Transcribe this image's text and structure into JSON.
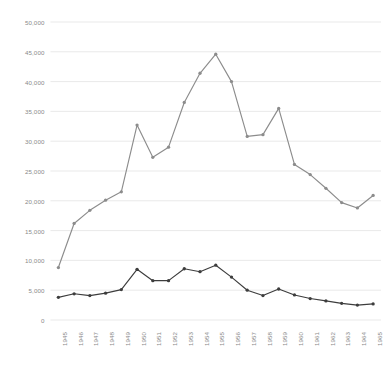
{
  "chart_data": {
    "type": "line",
    "title": "",
    "subtitle": "",
    "xlabel": "",
    "ylabel": "",
    "ylim": [
      0,
      50000
    ],
    "grid": true,
    "legend": "none",
    "y_ticks": [
      0,
      5000,
      10000,
      15000,
      20000,
      25000,
      30000,
      35000,
      40000,
      45000,
      50000
    ],
    "y_tick_labels": [
      "0",
      "5,000",
      "10,000",
      "15,000",
      "20,000",
      "25,000",
      "30,000",
      "35,000",
      "40,000",
      "45,000",
      "50,000"
    ],
    "categories": [
      "1945",
      "1946",
      "1947",
      "1948",
      "1949",
      "1950",
      "1951",
      "1952",
      "1953",
      "1954",
      "1955",
      "1956",
      "1957",
      "1958",
      "1959",
      "1960",
      "1961",
      "1962",
      "1963",
      "1964",
      "1965"
    ],
    "series": [
      {
        "name": "upper-series",
        "color": "#8c8c8c",
        "marker": "circle",
        "values": [
          8800,
          16200,
          18400,
          20100,
          21500,
          32700,
          27300,
          29000,
          36500,
          41400,
          44600,
          40000,
          30800,
          31100,
          35500,
          26100,
          24400,
          22100,
          19700,
          18800,
          20900
        ]
      },
      {
        "name": "lower-series",
        "color": "#3d3d3d",
        "marker": "circle",
        "values": [
          3800,
          4400,
          4100,
          4500,
          5100,
          8500,
          6600,
          6600,
          8600,
          8100,
          9200,
          7200,
          5000,
          4100,
          5200,
          4200,
          3600,
          3200,
          2800,
          2500,
          2700
        ]
      }
    ],
    "colors": {
      "gridline": "#e6e6e6",
      "axis_text": "#8a8a8a",
      "background": "#ffffff",
      "upper_series": "#8c8c8c",
      "lower_series": "#3d3d3d"
    }
  }
}
